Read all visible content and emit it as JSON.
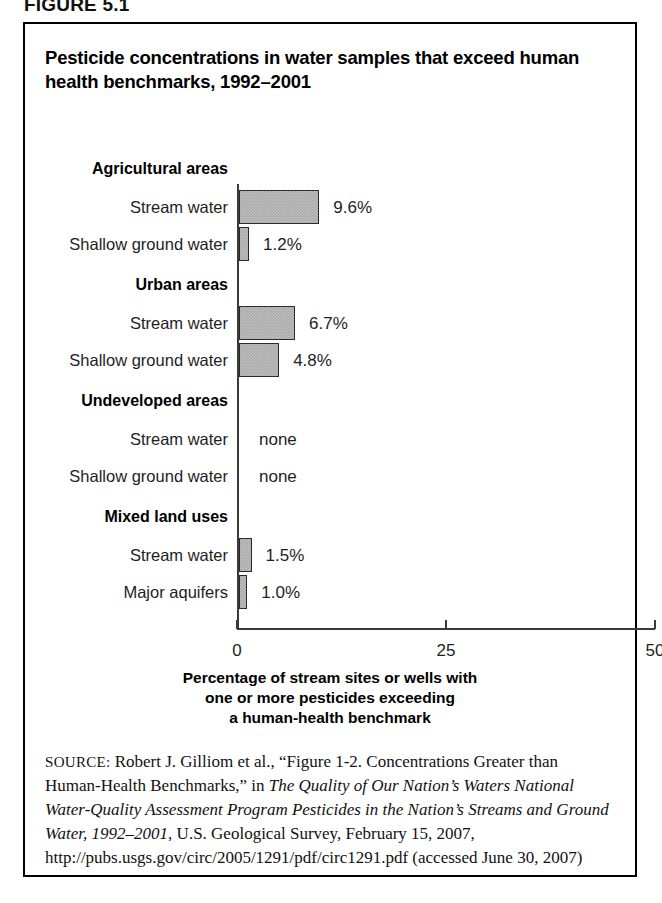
{
  "figure": {
    "kicker": "FIGURE 5.1",
    "title": "Pesticide concentrations in water samples that exceed human health benchmarks, 1992–2001"
  },
  "chart_data": {
    "type": "bar",
    "orientation": "horizontal",
    "title": "Pesticide concentrations in water samples that exceed human health benchmarks, 1992–2001",
    "xlabel": "Percentage of stream sites or wells with one or more pesticides exceeding a human-health benchmark",
    "ylabel": "",
    "xlim": [
      0,
      50
    ],
    "xticks": [
      0,
      25,
      50
    ],
    "xtick_labels": [
      "0",
      "25",
      "50"
    ],
    "grid": false,
    "legend": null,
    "bar_color": "#a9a9a9",
    "bar_edge_color": "#2b2b2b",
    "axis_color": "#3a3a3a",
    "groups": [
      {
        "name": "Agricultural areas",
        "rows": [
          {
            "category": "Stream water",
            "value": 9.6,
            "label": "9.6%"
          },
          {
            "category": "Shallow ground water",
            "value": 1.2,
            "label": "1.2%"
          }
        ]
      },
      {
        "name": "Urban areas",
        "rows": [
          {
            "category": "Stream water",
            "value": 6.7,
            "label": "6.7%"
          },
          {
            "category": "Shallow ground water",
            "value": 4.8,
            "label": "4.8%"
          }
        ]
      },
      {
        "name": "Undeveloped areas",
        "rows": [
          {
            "category": "Stream water",
            "value": null,
            "label": "none"
          },
          {
            "category": "Shallow ground water",
            "value": null,
            "label": "none"
          }
        ]
      },
      {
        "name": "Mixed land uses",
        "rows": [
          {
            "category": "Stream water",
            "value": 1.5,
            "label": "1.5%"
          },
          {
            "category": "Major aquifers",
            "value": 1.0,
            "label": "1.0%"
          }
        ]
      }
    ],
    "categories": [
      "Agricultural areas – Stream water",
      "Agricultural areas – Shallow ground water",
      "Urban areas – Stream water",
      "Urban areas – Shallow ground water",
      "Undeveloped areas – Stream water",
      "Undeveloped areas – Shallow ground water",
      "Mixed land uses – Stream water",
      "Mixed land uses – Major aquifers"
    ],
    "values": [
      9.6,
      1.2,
      6.7,
      4.8,
      null,
      null,
      1.5,
      1.0
    ],
    "value_labels": [
      "9.6%",
      "1.2%",
      "6.7%",
      "4.8%",
      "none",
      "none",
      "1.5%",
      "1.0%"
    ],
    "axis_title_lines": [
      "Percentage of stream sites or wells with",
      "one or more pesticides exceeding",
      "a human-health benchmark"
    ]
  },
  "source": {
    "label": "SOURCE:",
    "text_1": " Robert J. Gilliom et al., “Figure 1-2. Concentrations Greater than Human-Health Benchmarks,” in ",
    "italic_1": "The Quality of Our Nation’s Waters National Water-Quality Assessment Program Pesticides in the Nation’s Streams and Ground Water, 1992–2001",
    "text_2": ", U.S. Geological Survey, February 15, 2007, http://pubs.usgs.gov/circ/2005/1291/pdf/circ1291.pdf (accessed June 30, 2007)"
  }
}
